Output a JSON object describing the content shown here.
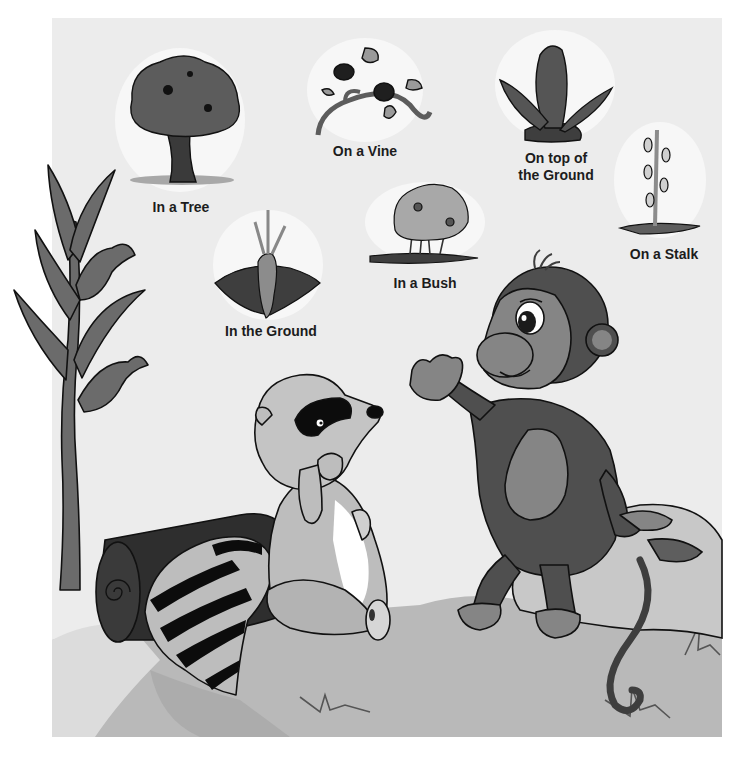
{
  "illustration": {
    "description": "Monkey and raccoon talking about where food grows",
    "palette": {
      "sky": "#ececec",
      "ground": "#b9b9b9",
      "ground_shadow": "#9d9d9d",
      "rock": "#c8c8c8",
      "monkey_fur": "#4f4f4f",
      "monkey_skin": "#858585",
      "raccoon_fur": "#bdbdbd",
      "log": "#2e2e2e",
      "corn": "#6b6b6b",
      "outline": "#111111",
      "sticker_halo": "#f7f7f7"
    },
    "characters": [
      {
        "name": "monkey",
        "pose": "sitting on rock, gesturing"
      },
      {
        "name": "raccoon",
        "pose": "sitting by log, hand on chin"
      }
    ]
  },
  "vignettes": [
    {
      "id": "tree",
      "label": "In a Tree"
    },
    {
      "id": "vine",
      "label": "On a Vine"
    },
    {
      "id": "top",
      "label_line1": "On top of",
      "label_line2": "the Ground"
    },
    {
      "id": "stalk",
      "label": "On a Stalk"
    },
    {
      "id": "bush",
      "label": "In a Bush"
    },
    {
      "id": "ground",
      "label": "In the Ground"
    }
  ]
}
